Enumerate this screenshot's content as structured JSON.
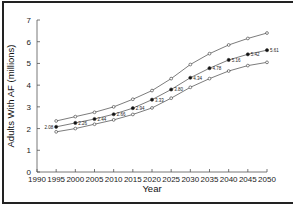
{
  "chart_data": {
    "type": "line",
    "title": "",
    "xlabel": "Year",
    "ylabel": "Adults With AF (millions)",
    "x": [
      1995,
      2000,
      2005,
      2010,
      2015,
      2020,
      2025,
      2030,
      2035,
      2040,
      2045,
      2050
    ],
    "xticks": [
      "1990",
      "1995",
      "2000",
      "2005",
      "2010",
      "2015",
      "2020",
      "2025",
      "2030",
      "2035",
      "2040",
      "2045",
      "2050"
    ],
    "yticks": [
      "0",
      "1",
      "2",
      "3",
      "4",
      "5",
      "6",
      "7"
    ],
    "xlim": [
      1990,
      2050
    ],
    "ylim": [
      0,
      7
    ],
    "grid": false,
    "legend": "none",
    "series": [
      {
        "name": "Upper bound",
        "marker": "open-circle",
        "values": [
          2.35,
          2.55,
          2.75,
          3.0,
          3.35,
          3.75,
          4.3,
          4.95,
          5.45,
          5.85,
          6.15,
          6.4
        ]
      },
      {
        "name": "Estimate",
        "marker": "filled-circle",
        "values": [
          2.08,
          2.26,
          2.44,
          2.66,
          2.94,
          3.33,
          3.8,
          4.34,
          4.78,
          5.16,
          5.42,
          5.61
        ],
        "labels": [
          "2.08",
          "2.26",
          "2.44",
          "2.66",
          "2.94",
          "3.33",
          "3.80",
          "4.34",
          "4.78",
          "5.16",
          "5.42",
          "5.61"
        ]
      },
      {
        "name": "Lower bound",
        "marker": "open-circle",
        "values": [
          1.85,
          2.0,
          2.2,
          2.4,
          2.65,
          2.95,
          3.4,
          3.9,
          4.3,
          4.65,
          4.9,
          5.05
        ]
      }
    ]
  }
}
